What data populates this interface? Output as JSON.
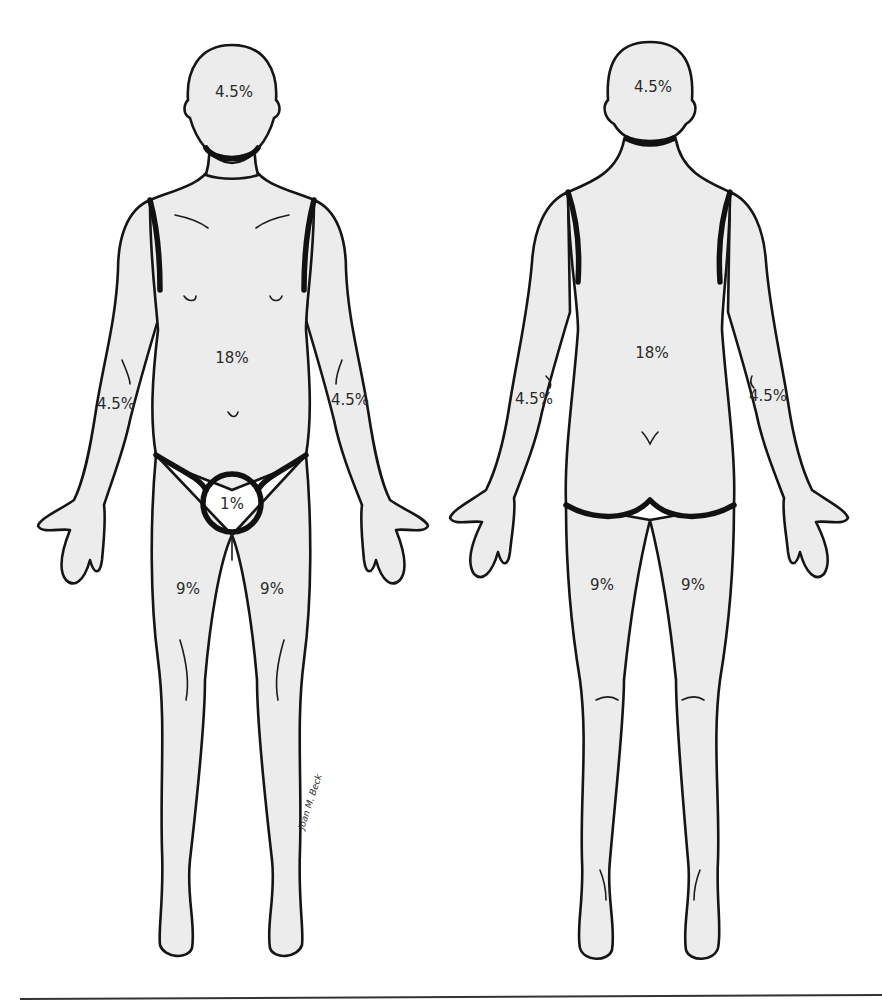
{
  "figure": {
    "colors": {
      "fill": "#ececec",
      "outline": "#151515",
      "background": "#ffffff"
    }
  },
  "front_view": {
    "labels": {
      "head": "4.5%",
      "trunk": "18%",
      "right_arm": "4.5%",
      "left_arm": "4.5%",
      "genitalia": "1%",
      "right_leg": "9%",
      "left_leg": "9%"
    }
  },
  "back_view": {
    "labels": {
      "head": "4.5%",
      "trunk": "18%",
      "left_arm": "4.5%",
      "right_arm": "4.5%",
      "left_leg": "9%",
      "right_leg": "9%"
    }
  },
  "signature": "Joan M. Beck"
}
